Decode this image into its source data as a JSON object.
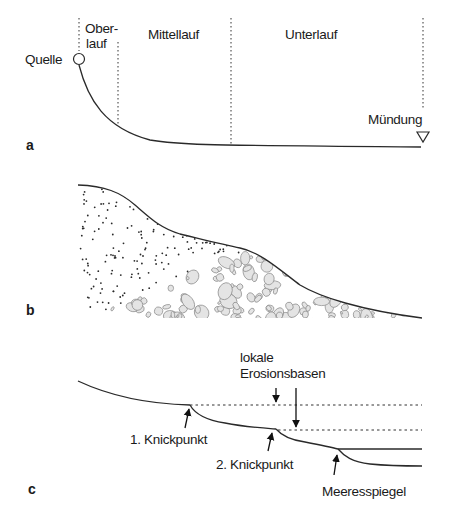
{
  "panel_a": {
    "letter": "a",
    "labels": {
      "source": "Quelle",
      "upper_course_line1": "Ober-",
      "upper_course_line2": "lauf",
      "middle_course": "Mittellauf",
      "lower_course": "Unterlauf",
      "mouth": "Mündung"
    }
  },
  "panel_b": {
    "letter": "b"
  },
  "panel_c": {
    "letter": "c",
    "labels": {
      "local_base_line1": "lokale",
      "local_base_line2": "Erosionsbasen",
      "knickpoint_1": "1. Knickpunkt",
      "knickpoint_2": "2. Knickpunkt",
      "sea_level": "Meeresspiegel"
    }
  }
}
